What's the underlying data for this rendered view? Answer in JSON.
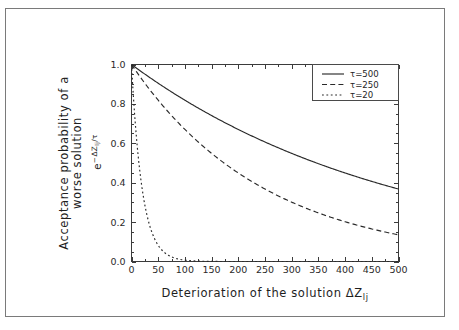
{
  "figure": {
    "background_color": "#ffffff",
    "frame_color": "#7a7a7a",
    "axis_color": "#3b3b3b",
    "curve_color": "#2a2a2a"
  },
  "chart_data": {
    "type": "line",
    "title": "",
    "xlabel": "Deterioration of the solution ΔZ",
    "xlabel_sub": "lj",
    "ylabel_line1": "Acceptance probability of a",
    "ylabel_line2": "worse solution",
    "ylabel_math_base": "e",
    "ylabel_math_exp_minus": "−",
    "ylabel_math_exp_delta": "ΔZ",
    "ylabel_math_exp_sub": "lj",
    "ylabel_math_exp_div": "/τ",
    "xlim": [
      0,
      500
    ],
    "ylim": [
      0.0,
      1.0
    ],
    "xticks": [
      0,
      50,
      100,
      150,
      200,
      250,
      300,
      350,
      400,
      450,
      500
    ],
    "xtick_labels": [
      "0",
      "50",
      "100",
      "150",
      "200",
      "250",
      "300",
      "350",
      "400",
      "450",
      "500"
    ],
    "yticks": [
      0.0,
      0.2,
      0.4,
      0.6,
      0.8,
      1.0
    ],
    "ytick_labels": [
      "0.0",
      "0.2",
      "0.4",
      "0.6",
      "0.8",
      "1.0"
    ],
    "x_minor_step": 25,
    "y_minor_step": 0.05,
    "grid": false,
    "legend_position": "upper right",
    "series": [
      {
        "name": "τ=500",
        "tau": 500,
        "style": "solid",
        "x": [
          0,
          25,
          50,
          75,
          100,
          125,
          150,
          175,
          200,
          225,
          250,
          275,
          300,
          325,
          350,
          375,
          400,
          425,
          450,
          475,
          500
        ],
        "values": [
          1.0,
          0.951,
          0.905,
          0.861,
          0.819,
          0.779,
          0.741,
          0.705,
          0.67,
          0.638,
          0.607,
          0.577,
          0.549,
          0.522,
          0.497,
          0.472,
          0.449,
          0.427,
          0.407,
          0.387,
          0.368
        ]
      },
      {
        "name": "τ=250",
        "tau": 250,
        "style": "dashed",
        "x": [
          0,
          25,
          50,
          75,
          100,
          125,
          150,
          175,
          200,
          225,
          250,
          275,
          300,
          325,
          350,
          375,
          400,
          425,
          450,
          475,
          500
        ],
        "values": [
          1.0,
          0.905,
          0.819,
          0.741,
          0.67,
          0.607,
          0.549,
          0.497,
          0.449,
          0.407,
          0.368,
          0.333,
          0.301,
          0.273,
          0.247,
          0.223,
          0.202,
          0.183,
          0.165,
          0.15,
          0.135
        ]
      },
      {
        "name": "τ=20",
        "tau": 20,
        "style": "dotted",
        "x": [
          0,
          5,
          10,
          15,
          20,
          25,
          30,
          40,
          50,
          60,
          70,
          80,
          90,
          100,
          125,
          150,
          200,
          250,
          300,
          350,
          400,
          450,
          500
        ],
        "values": [
          1.0,
          0.779,
          0.607,
          0.472,
          0.368,
          0.287,
          0.223,
          0.135,
          0.082,
          0.05,
          0.03,
          0.018,
          0.011,
          0.007,
          0.002,
          0.001,
          0.0,
          0.0,
          0.0,
          0.0,
          0.0,
          0.0,
          0.0
        ]
      }
    ]
  },
  "legend": {
    "entries": [
      {
        "label": "τ=500",
        "style": "solid"
      },
      {
        "label": "τ=250",
        "style": "dashed"
      },
      {
        "label": "τ=20",
        "style": "dotted"
      }
    ]
  }
}
